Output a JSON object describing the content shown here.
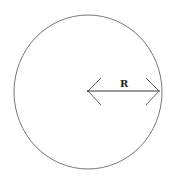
{
  "diagram": {
    "title": "",
    "shape": "circle",
    "radius_label": "R",
    "stroke_color": "#777777",
    "arrow_color": "#333333"
  }
}
